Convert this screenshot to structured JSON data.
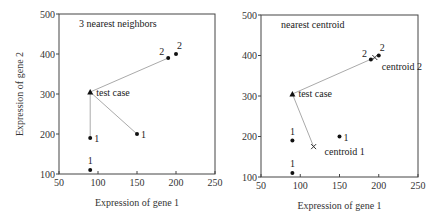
{
  "chart_data": [
    {
      "type": "scatter",
      "title": "3 nearest neighbors",
      "xlabel": "Expression of gene 1",
      "ylabel": "Expression of gene 2",
      "xlim": [
        50,
        250
      ],
      "ylim": [
        100,
        500
      ],
      "xticks": [
        50,
        100,
        150,
        200,
        250
      ],
      "yticks": [
        100,
        200,
        300,
        400,
        500
      ],
      "frame": {
        "x0": 59,
        "x1": 215,
        "y0": 14,
        "y1": 174
      },
      "points": [
        {
          "x": 90,
          "y": 110,
          "label": "1",
          "class": 1,
          "label_pos": "above"
        },
        {
          "x": 90,
          "y": 190,
          "label": "1",
          "class": 1,
          "label_pos": "right"
        },
        {
          "x": 150,
          "y": 200,
          "label": "1",
          "class": 1,
          "label_pos": "right"
        },
        {
          "x": 190,
          "y": 390,
          "label": "2",
          "class": 2,
          "label_pos": "left-above"
        },
        {
          "x": 200,
          "y": 400,
          "label": "2",
          "class": 2,
          "label_pos": "right-above"
        }
      ],
      "test_case": {
        "x": 90,
        "y": 305,
        "label": "test case"
      },
      "connections": [
        [
          90,
          190
        ],
        [
          150,
          200
        ],
        [
          190,
          390
        ]
      ]
    },
    {
      "type": "scatter",
      "title": "nearest centroid",
      "xlabel": "Expression of gene 1",
      "ylabel": "",
      "xlim": [
        50,
        250
      ],
      "ylim": [
        100,
        500
      ],
      "xticks": [
        50,
        100,
        150,
        200,
        250
      ],
      "yticks": [
        100,
        200,
        300,
        400,
        500
      ],
      "frame": {
        "x0": 261,
        "x1": 418,
        "y0": 15,
        "y1": 177
      },
      "points": [
        {
          "x": 90,
          "y": 110,
          "label": "1",
          "class": 1,
          "label_pos": "above"
        },
        {
          "x": 90,
          "y": 190,
          "label": "1",
          "class": 1,
          "label_pos": "above"
        },
        {
          "x": 150,
          "y": 200,
          "label": "1",
          "class": 1,
          "label_pos": "right"
        },
        {
          "x": 190,
          "y": 390,
          "label": "2",
          "class": 2,
          "label_pos": "left-above"
        },
        {
          "x": 200,
          "y": 400,
          "label": "2",
          "class": 2,
          "label_pos": "right-above"
        }
      ],
      "test_case": {
        "x": 90,
        "y": 305,
        "label": "test case"
      },
      "centroids": [
        {
          "x": 117,
          "y": 175,
          "label": "centroid 1"
        },
        {
          "x": 195,
          "y": 395,
          "label": "centroid 2"
        }
      ],
      "connections": [
        [
          117,
          175
        ],
        [
          195,
          395
        ]
      ]
    }
  ]
}
